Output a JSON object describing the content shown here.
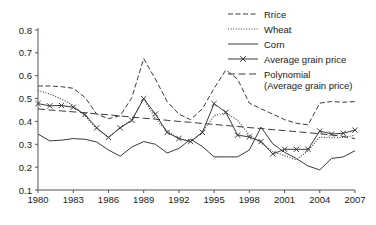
{
  "chart_data": {
    "type": "line",
    "title": "",
    "xlabel": "",
    "ylabel": "",
    "xlim": [
      1980,
      2007
    ],
    "ylim": [
      0.1,
      0.8
    ],
    "grid": false,
    "legend_position": "top-right",
    "x": [
      1980,
      1981,
      1982,
      1983,
      1984,
      1985,
      1986,
      1987,
      1988,
      1989,
      1990,
      1991,
      1992,
      1993,
      1994,
      1995,
      1996,
      1997,
      1998,
      1999,
      2000,
      2001,
      2002,
      2003,
      2004,
      2005,
      2006,
      2007
    ],
    "xtick_labels": [
      "1980",
      "1983",
      "1986",
      "1989",
      "1992",
      "1995",
      "1998",
      "2001",
      "2004",
      "2007"
    ],
    "ytick_labels": [
      "0.1",
      "0.2",
      "0.3",
      "0.4",
      "0.5",
      "0.6",
      "0.7",
      "0.8"
    ],
    "series": [
      {
        "name": "Rrice",
        "style": "dashed",
        "values": [
          0.555,
          0.555,
          0.552,
          0.545,
          0.505,
          0.432,
          0.412,
          0.425,
          0.505,
          0.675,
          0.585,
          0.487,
          0.432,
          0.408,
          0.455,
          0.545,
          0.625,
          0.585,
          0.48,
          0.455,
          0.432,
          0.408,
          0.392,
          0.385,
          0.48,
          0.487,
          0.484,
          0.487
        ]
      },
      {
        "name": "Wheat",
        "style": "dotted",
        "values": [
          0.535,
          0.52,
          0.498,
          0.47,
          0.425,
          0.368,
          0.33,
          0.372,
          0.408,
          0.5,
          0.412,
          0.358,
          0.325,
          0.312,
          0.352,
          0.425,
          0.438,
          0.405,
          0.34,
          0.305,
          0.268,
          0.25,
          0.232,
          0.272,
          0.332,
          0.328,
          0.33,
          0.34
        ]
      },
      {
        "name": "Corn",
        "style": "solid",
        "values": [
          0.345,
          0.315,
          0.318,
          0.325,
          0.322,
          0.31,
          0.275,
          0.248,
          0.288,
          0.312,
          0.3,
          0.262,
          0.282,
          0.322,
          0.29,
          0.245,
          0.245,
          0.245,
          0.275,
          0.375,
          0.302,
          0.265,
          0.238,
          0.205,
          0.188,
          0.238,
          0.245,
          0.272
        ]
      },
      {
        "name": "Average grain price",
        "style": "solid-marker",
        "marker": "x",
        "values": [
          0.478,
          0.468,
          0.47,
          0.462,
          0.43,
          0.372,
          0.33,
          0.372,
          0.405,
          0.5,
          0.432,
          0.352,
          0.325,
          0.312,
          0.352,
          0.478,
          0.44,
          0.34,
          0.332,
          0.312,
          0.258,
          0.278,
          0.278,
          0.278,
          0.358,
          0.345,
          0.348,
          0.362
        ]
      },
      {
        "name": "Polynomial (Average grain price)",
        "style": "long-dash",
        "values": [
          0.455,
          0.45,
          0.446,
          0.442,
          0.438,
          0.433,
          0.429,
          0.424,
          0.419,
          0.414,
          0.41,
          0.405,
          0.4,
          0.396,
          0.391,
          0.387,
          0.382,
          0.378,
          0.373,
          0.369,
          0.364,
          0.36,
          0.355,
          0.351,
          0.346,
          0.341,
          0.334,
          0.325
        ]
      }
    ]
  },
  "legend": {
    "items": [
      {
        "label": "Rrice",
        "style": "dashed"
      },
      {
        "label": "Wheat",
        "style": "dotted"
      },
      {
        "label": "Corn",
        "style": "solid"
      },
      {
        "label": "Average grain price",
        "style": "solid-marker"
      },
      {
        "label": "Polynomial",
        "label2": "(Average grain price)",
        "style": "long-dash"
      }
    ]
  },
  "colors": {
    "ink": "#3a3a3a",
    "axis": "#555555",
    "background": "#ffffff"
  }
}
